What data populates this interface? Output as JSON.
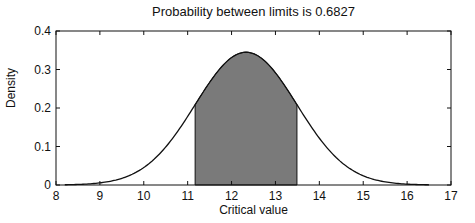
{
  "chart_data": {
    "type": "area",
    "title": "Probability between limits is 0.6827",
    "xlabel": "Critical value",
    "ylabel": "Density",
    "xlim": [
      8,
      17
    ],
    "ylim": [
      0,
      0.4
    ],
    "xticks": [
      8,
      9,
      10,
      11,
      12,
      13,
      14,
      15,
      16,
      17
    ],
    "yticks": [
      0,
      0.1,
      0.2,
      0.3,
      0.4
    ],
    "ytick_labels": [
      "0",
      "0.1",
      "0.2",
      "0.3",
      "0.4"
    ],
    "grid": false,
    "legend": null,
    "distribution": "normal",
    "mean": 12.33,
    "std": 1.157,
    "curve_range": [
      8.2,
      16.5
    ],
    "shaded_limits": [
      11.17,
      13.49
    ],
    "probability": 0.6827,
    "peak_density": 0.345,
    "sample_points": {
      "x": [
        8.2,
        9,
        10,
        11,
        11.17,
        12,
        12.33,
        13,
        13.49,
        14,
        15,
        16,
        16.5
      ],
      "y": [
        0.0006,
        0.0055,
        0.045,
        0.177,
        0.21,
        0.333,
        0.345,
        0.293,
        0.21,
        0.12,
        0.025,
        0.0022,
        0.0008
      ]
    },
    "colors": {
      "fill": "#7a7a7a",
      "line": "#111111",
      "axes": "#111111"
    }
  }
}
